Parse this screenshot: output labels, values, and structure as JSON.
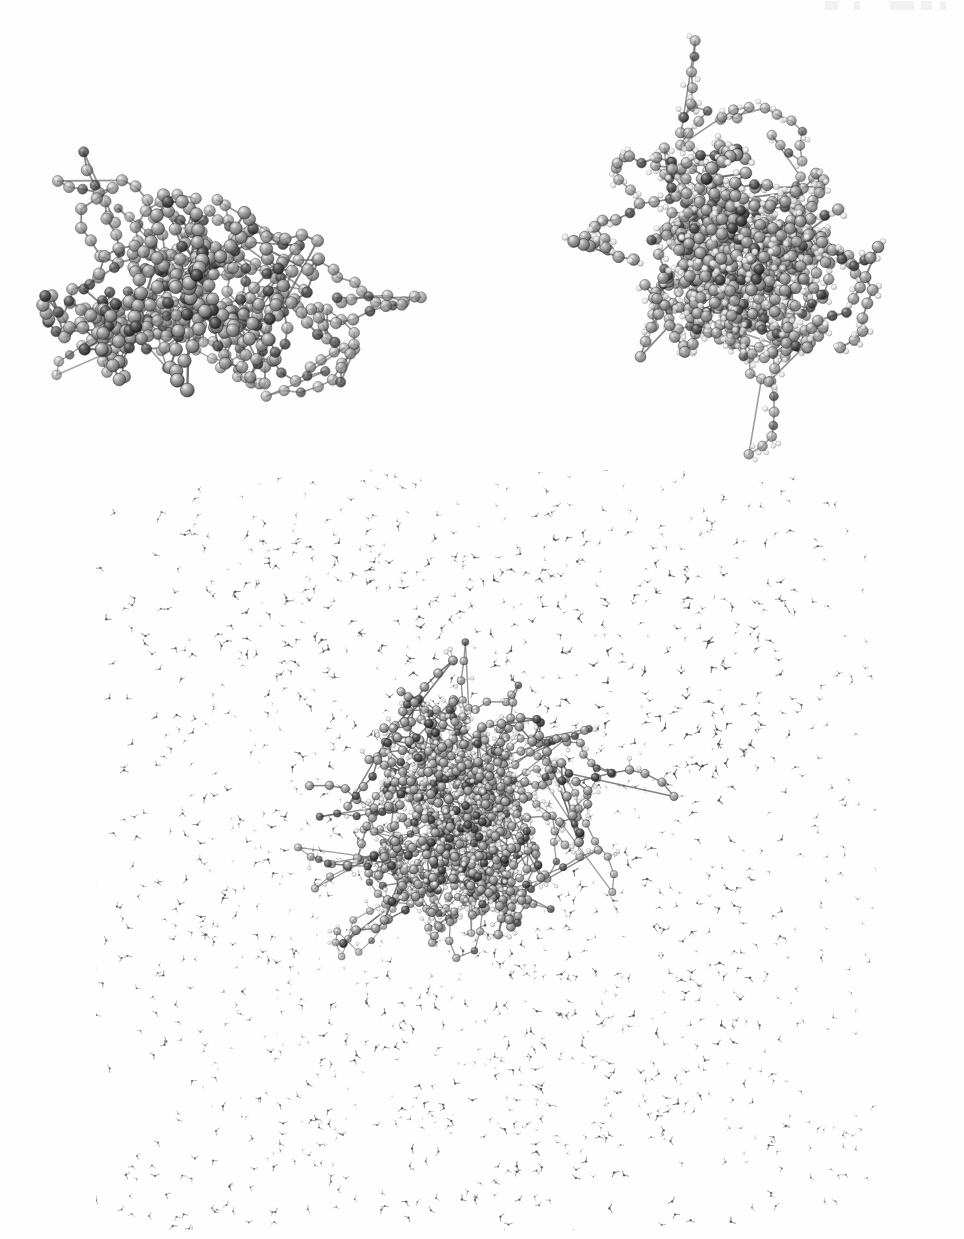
{
  "figure": {
    "background_color": "#ffffff",
    "width": 964,
    "height": 1239,
    "panel_count": 3,
    "caption": "",
    "page_header_text": ""
  },
  "panels": [
    {
      "id": "panel-heavy",
      "name": "united-atom-model",
      "position": "top-left",
      "representation": "ball-and-stick",
      "shows_hydrogens": false,
      "atom_count_visible": 330,
      "bond_count_visible": 360,
      "x": 22,
      "y": 78,
      "width": 420,
      "height": 392
    },
    {
      "id": "panel-hydro",
      "name": "all-atom-model",
      "position": "top-right",
      "representation": "ball-and-stick",
      "shows_hydrogens": true,
      "atom_count_visible": 430,
      "hydrogen_count_visible": 300,
      "bond_count_visible": 470,
      "x": 498,
      "y": 18,
      "width": 452,
      "height": 460
    },
    {
      "id": "panel-solv",
      "name": "solvated-system",
      "position": "bottom",
      "representation": "ball-and-stick solute in wireframe solvent box",
      "shows_hydrogens": true,
      "solvent": "water",
      "solvent_molecule_count": 1600,
      "solute_atom_count_visible": 560,
      "x": 96,
      "y": 470,
      "width": 780,
      "height": 760
    }
  ],
  "atom_styles": {
    "carbon": {
      "label": "C",
      "fill": "#8e8e8e",
      "highlight": "#e3e3e3",
      "shadow": "#3d3d3d",
      "radius": 6.2
    },
    "heteroatom": {
      "label": "O/N",
      "fill": "#3a3a3a",
      "highlight": "#9a9a9a",
      "shadow": "#111111",
      "radius": 5.6
    },
    "hydrogen": {
      "label": "H",
      "fill": "#f2f2f2",
      "highlight": "#ffffff",
      "shadow": "#8a8a8a",
      "radius": 3.1
    },
    "bond": {
      "stroke": "#6e6e6e",
      "width": 2.0
    },
    "solvent_bond": {
      "stroke": "#707070",
      "width": 0.85
    },
    "solvent_atom": {
      "fill": "#5e5e5e",
      "radius": 0.95
    }
  },
  "geometry_seed": {
    "heavy_seed": 20113,
    "hydro_seed": 74029,
    "solvent_seed": 31877,
    "solute_seed": 52641
  },
  "colors": {
    "background": "#ffffff",
    "ink": "#000000",
    "midtone_grey": "#8e8e8e",
    "dark_grey": "#3a3a3a",
    "light_grey": "#e8e8e8"
  }
}
